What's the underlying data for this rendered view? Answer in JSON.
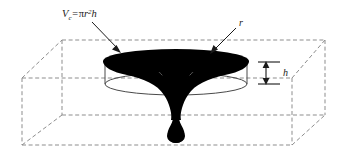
{
  "figure": {
    "background_color": "#ffffff",
    "labels": {
      "formula": {
        "variable": "V",
        "subscript": "c",
        "equals": "=",
        "expression_pi": "π",
        "expression_r": "r",
        "exponent": "2",
        "expression_h": "h",
        "full_text": "Vc = πr²h"
      },
      "radius": {
        "symbol": "r",
        "meaning": "radius"
      },
      "height": {
        "symbol": "h",
        "meaning": "height"
      }
    },
    "colors": {
      "vortex": "#000000",
      "box_edge": "#8d8d8d",
      "cylinder_outline": "#4a4a4a",
      "text": "#1a1a1a",
      "dimension_line": "#000000"
    },
    "elements": {
      "bounding_box": "dashed-parallelepiped",
      "cylinder": "open-cylinder-outline",
      "vortex": "funnel-whirlpool-solid",
      "radius_leader": "arrow-pointing-to-top-ellipse-right-edge",
      "formula_leader": "arrow-pointing-to-top-ellipse-left-edge",
      "height_dimension": "double-headed-vertical-arrow"
    }
  }
}
